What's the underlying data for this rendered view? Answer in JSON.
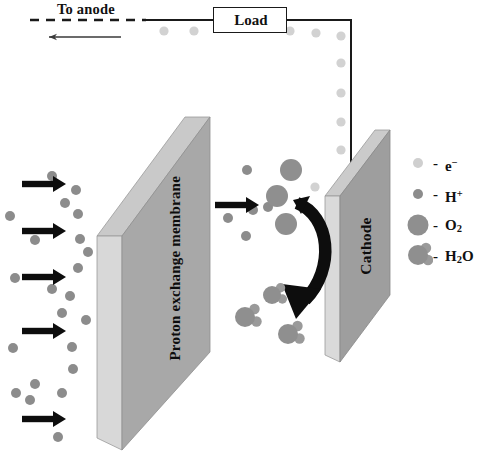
{
  "circuit": {
    "to_anode_label": "To anode",
    "load_label": "Load",
    "electron_flow_direction": "left",
    "wire_color": "#1a1a1a"
  },
  "membrane": {
    "label": "Proton exchange membrane",
    "face_color": "#a8a8a8",
    "edge_color": "#c9c9c9"
  },
  "cathode": {
    "label": "Cathode",
    "face_color": "#9e9e9e",
    "edge_color": "#c9c9c9"
  },
  "legend": {
    "items": [
      {
        "name": "electron",
        "dash": "-",
        "label": "e",
        "sup": "−",
        "sub": "",
        "icon": "electron-dot",
        "color": "#cfcfcf",
        "radius": 5.0
      },
      {
        "name": "proton",
        "dash": "-",
        "label": "H",
        "sup": "+",
        "sub": "",
        "icon": "proton-dot",
        "color": "#8c8c8c",
        "radius": 5.0
      },
      {
        "name": "oxygen",
        "dash": "-",
        "label": "O",
        "sup": "",
        "sub": "2",
        "icon": "oxygen-circle",
        "color": "#8f8f8f",
        "radius": 10.5
      },
      {
        "name": "water",
        "dash": "-",
        "label": "H",
        "sup": "",
        "sub": "2",
        "label2": "O",
        "icon": "water-molecule",
        "color": "#8f8f8f",
        "radius": 10.0
      }
    ]
  },
  "colors": {
    "electron": "#d2d2d2",
    "proton": "#8c8c8c",
    "oxygen": "#8f8f8f",
    "water_o": "#8f8f8f",
    "water_h": "#9a9a9a",
    "arrow_black": "#0d0d0d",
    "background": "#ffffff"
  },
  "graphics": {
    "wire_electrons": [
      {
        "x": 164,
        "y": 31
      },
      {
        "x": 194,
        "y": 31
      },
      {
        "x": 290,
        "y": 31
      },
      {
        "x": 316,
        "y": 33
      },
      {
        "x": 341,
        "y": 36
      },
      {
        "x": 341,
        "y": 63
      },
      {
        "x": 341,
        "y": 93
      },
      {
        "x": 341,
        "y": 122
      },
      {
        "x": 341,
        "y": 150
      }
    ],
    "anode_arrows": [
      {
        "x": 22,
        "y": 184,
        "len": 42
      },
      {
        "x": 22,
        "y": 231,
        "len": 42
      },
      {
        "x": 22,
        "y": 277,
        "len": 42
      },
      {
        "x": 22,
        "y": 331,
        "len": 42
      },
      {
        "x": 22,
        "y": 419,
        "len": 42
      },
      {
        "x": 215,
        "y": 205,
        "len": 42
      }
    ],
    "protons_left": [
      {
        "x": 52,
        "y": 176
      },
      {
        "x": 76,
        "y": 190
      },
      {
        "x": 65,
        "y": 203
      },
      {
        "x": 10,
        "y": 216
      },
      {
        "x": 35,
        "y": 240
      },
      {
        "x": 80,
        "y": 239
      },
      {
        "x": 78,
        "y": 214
      },
      {
        "x": 15,
        "y": 278
      },
      {
        "x": 52,
        "y": 289
      },
      {
        "x": 70,
        "y": 296
      },
      {
        "x": 62,
        "y": 313
      },
      {
        "x": 78,
        "y": 268
      },
      {
        "x": 13,
        "y": 348
      },
      {
        "x": 72,
        "y": 347
      },
      {
        "x": 35,
        "y": 384
      },
      {
        "x": 62,
        "y": 393
      },
      {
        "x": 16,
        "y": 393
      },
      {
        "x": 30,
        "y": 400
      },
      {
        "x": 73,
        "y": 369
      },
      {
        "x": 58,
        "y": 437
      },
      {
        "x": 88,
        "y": 252
      },
      {
        "x": 86,
        "y": 320
      }
    ],
    "protons_mid": [
      {
        "x": 247,
        "y": 170
      },
      {
        "x": 253,
        "y": 210
      },
      {
        "x": 228,
        "y": 218
      },
      {
        "x": 246,
        "y": 236
      },
      {
        "x": 268,
        "y": 207
      }
    ],
    "oxygen_molecules": [
      {
        "x": 291,
        "y": 170,
        "r": 11
      },
      {
        "x": 277,
        "y": 196,
        "r": 11
      },
      {
        "x": 286,
        "y": 224,
        "r": 11
      }
    ],
    "water_molecules": [
      {
        "x": 272,
        "y": 295,
        "r": 9
      },
      {
        "x": 245,
        "y": 317,
        "r": 10
      },
      {
        "x": 288,
        "y": 334,
        "r": 10
      }
    ],
    "mid_electrons": [
      {
        "x": 315,
        "y": 187
      }
    ]
  }
}
